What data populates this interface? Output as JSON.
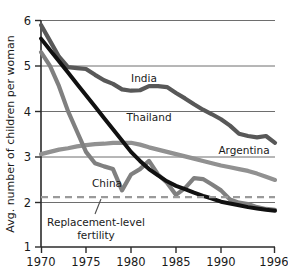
{
  "chart_data": {
    "type": "line",
    "title": "",
    "subtitle": "",
    "xlabel": "",
    "ylabel": "Avg. number of children per woman",
    "xlim": [
      1970,
      1996
    ],
    "ylim": [
      1,
      6
    ],
    "xticks": [
      "1970",
      "1975",
      "1980",
      "1985",
      "1990",
      "1996"
    ],
    "xtick_values": [
      1970,
      1975,
      1980,
      1985,
      1990,
      1996
    ],
    "yticks": [
      "1",
      "2",
      "3",
      "4",
      "5",
      "6"
    ],
    "ytick_values": [
      1,
      2,
      3,
      4,
      5,
      6
    ],
    "grid": "horizontal",
    "legend_position": "inline-labels",
    "x": [
      1970,
      1971,
      1972,
      1973,
      1974,
      1975,
      1976,
      1977,
      1978,
      1979,
      1980,
      1981,
      1982,
      1983,
      1984,
      1985,
      1986,
      1987,
      1988,
      1989,
      1990,
      1991,
      1992,
      1993,
      1994,
      1995,
      1996
    ],
    "series": [
      {
        "name": "India",
        "color": "#585858",
        "label": "India",
        "label_x": 1981.0,
        "label_y": 4.95,
        "values": [
          5.9,
          5.55,
          5.2,
          4.97,
          4.95,
          4.93,
          4.8,
          4.68,
          4.6,
          4.48,
          4.45,
          4.46,
          4.55,
          4.55,
          4.53,
          4.4,
          4.28,
          4.15,
          4.03,
          3.93,
          3.82,
          3.68,
          3.5,
          3.45,
          3.42,
          3.45,
          3.3
        ]
      },
      {
        "name": "Thailand",
        "color": "#111111",
        "label": "Thailand",
        "label_x": 1979.2,
        "label_y": 4.2,
        "values": [
          5.6,
          5.35,
          5.1,
          4.85,
          4.6,
          4.35,
          4.1,
          3.85,
          3.6,
          3.35,
          3.1,
          2.9,
          2.72,
          2.58,
          2.45,
          2.35,
          2.28,
          2.2,
          2.13,
          2.07,
          2.0,
          1.96,
          1.92,
          1.88,
          1.85,
          1.82,
          1.8
        ]
      },
      {
        "name": "China",
        "color": "#808080",
        "label": "China",
        "label_x": 1976.0,
        "label_y": 2.42,
        "values": [
          5.3,
          5.0,
          4.55,
          4.0,
          3.55,
          3.1,
          2.85,
          2.78,
          2.72,
          2.25,
          2.6,
          2.72,
          2.9,
          2.6,
          2.42,
          2.15,
          2.3,
          2.52,
          2.5,
          2.38,
          2.25,
          2.05,
          1.98,
          1.95,
          1.88,
          1.84,
          1.82
        ]
      },
      {
        "name": "Argentina",
        "color": "#919191",
        "label": "Argentina",
        "label_x": 1990.0,
        "label_y": 3.1,
        "values": [
          3.05,
          3.1,
          3.15,
          3.18,
          3.22,
          3.25,
          3.27,
          3.28,
          3.3,
          3.3,
          3.3,
          3.26,
          3.2,
          3.15,
          3.1,
          3.05,
          3.0,
          2.95,
          2.9,
          2.85,
          2.8,
          2.76,
          2.72,
          2.68,
          2.62,
          2.55,
          2.48
        ]
      }
    ],
    "reference_line": {
      "label": "Replacement-level fertility",
      "label_line1": "Replacement-level",
      "label_line2": "fertility",
      "value": 2.1,
      "style": "dashed",
      "color": "#9a9a9a"
    }
  }
}
